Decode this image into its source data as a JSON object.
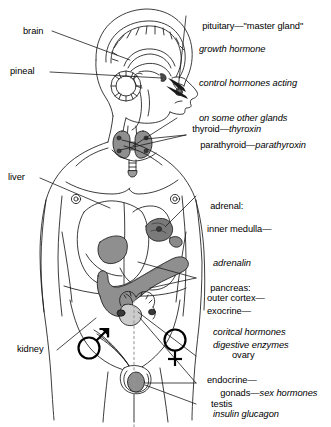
{
  "diagram": {
    "background_color": "#ffffff",
    "ink_color": "#1a1a1a",
    "organ_fill_color": "#8f8f8f",
    "organ_dark_color": "#4d4d4d"
  },
  "labels": {
    "brain": "brain",
    "pineal": "pineal",
    "liver": "liver",
    "kidney": "kidney",
    "pituitary_head": "pituitary—\"master gland\"",
    "pituitary_line2": "growth hormone",
    "pituitary_line3": "control hormones acting",
    "pituitary_line4": "on some other glands",
    "thyroid_plain": "thyroid—",
    "thyroid_italic": "thyroxin",
    "parathyroid_plain": "parathyroid—",
    "parathyroid_italic": "parathyroxin",
    "adrenal_head": "adrenal:",
    "adrenal_line2": "inner medulla—",
    "adrenal_line3": "adrenalin",
    "adrenal_line4": "outer cortex—",
    "adrenal_line5": "coritcal hormones",
    "pancreas_head": "pancreas:",
    "pancreas_line2": "exocrine—",
    "pancreas_line3": "digestive enzymes",
    "pancreas_line4": "endocrine—",
    "pancreas_line5": "insulin glucagon",
    "ovary": "ovary",
    "gonads_plain": "gonads—",
    "gonads_italic": "sex hormones",
    "testis": "testis"
  },
  "symbols": {
    "male": "male-symbol",
    "female": "female-symbol"
  },
  "icons": {
    "brain_icon": "brain-icon",
    "head_icon": "head-profile-icon",
    "torso_icon": "torso-icon",
    "thyroid_icon": "thyroid-gland-icon",
    "liver_icon": "liver-icon",
    "pancreas_icon": "pancreas-icon",
    "adrenal_icon": "adrenal-gland-icon",
    "kidney_icon": "kidney-icon",
    "ovary_icon": "ovary-icon",
    "testis_icon": "testis-icon"
  }
}
